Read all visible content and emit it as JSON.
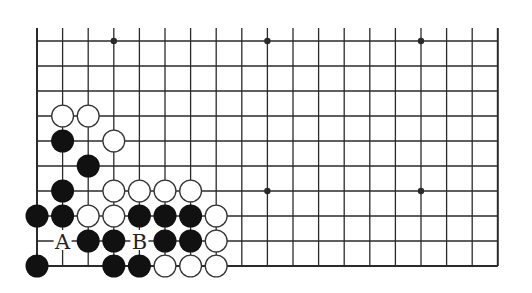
{
  "diagram": {
    "type": "go-board-partial",
    "board": {
      "columns": 19,
      "rows": 10,
      "open_edge": "top",
      "closed_edges": [
        "left",
        "right",
        "bottom"
      ],
      "origin_x": 37,
      "origin_y": 41,
      "spacing_x": 25.6,
      "spacing_y": 25,
      "top_extension": 13,
      "line_color": "#2a2a2a",
      "stone_diameter": 23
    },
    "star_points": [
      [
        3,
        0
      ],
      [
        9,
        0
      ],
      [
        15,
        0
      ],
      [
        3,
        6
      ],
      [
        9,
        6
      ],
      [
        15,
        6
      ]
    ],
    "stones": {
      "black": [
        [
          1,
          4
        ],
        [
          2,
          5
        ],
        [
          1,
          6
        ],
        [
          0,
          7
        ],
        [
          1,
          7
        ],
        [
          4,
          7
        ],
        [
          5,
          7
        ],
        [
          6,
          7
        ],
        [
          2,
          8
        ],
        [
          3,
          8
        ],
        [
          5,
          8
        ],
        [
          6,
          8
        ],
        [
          0,
          9
        ],
        [
          3,
          9
        ],
        [
          4,
          9
        ]
      ],
      "white": [
        [
          1,
          3
        ],
        [
          2,
          3
        ],
        [
          3,
          4
        ],
        [
          3,
          6
        ],
        [
          4,
          6
        ],
        [
          5,
          6
        ],
        [
          6,
          6
        ],
        [
          2,
          7
        ],
        [
          3,
          7
        ],
        [
          7,
          7
        ],
        [
          7,
          8
        ],
        [
          5,
          9
        ],
        [
          6,
          9
        ],
        [
          7,
          9
        ]
      ]
    },
    "labels": [
      {
        "text": "A",
        "col": 1,
        "row": 8
      },
      {
        "text": "B",
        "col": 4,
        "row": 8
      }
    ],
    "colors": {
      "black_stone": "#111111",
      "white_stone_fill": "#ffffff",
      "white_stone_stroke": "#333333",
      "background": "#ffffff"
    }
  }
}
